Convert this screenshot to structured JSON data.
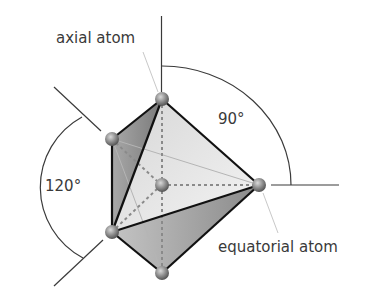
{
  "diagram": {
    "labels": {
      "axial": "axial atom",
      "equatorial": "equatorial atom",
      "angle_axial": "90°",
      "angle_equatorial": "120°"
    },
    "atoms": [
      {
        "id": "axial-top",
        "x": 162,
        "y": 99
      },
      {
        "id": "equatorial-upper-left",
        "x": 112,
        "y": 139
      },
      {
        "id": "central",
        "x": 162,
        "y": 185
      },
      {
        "id": "equatorial-right",
        "x": 259,
        "y": 185
      },
      {
        "id": "equatorial-lower-left",
        "x": 112,
        "y": 232
      },
      {
        "id": "axial-bottom",
        "x": 162,
        "y": 273
      }
    ],
    "colors": {
      "edge": "#111111",
      "face_dark": "#8c8c8c",
      "face_mid": "#b8b8b8",
      "face_light": "#e4e4e4",
      "dashed": "#8a8a8a",
      "annotation": "#3a3a3a",
      "leader": "#c8c8c8"
    }
  }
}
